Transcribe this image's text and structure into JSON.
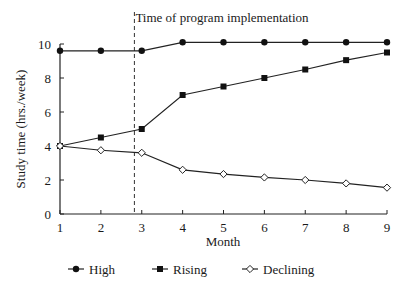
{
  "chart_data": {
    "type": "line",
    "title": "",
    "xlabel": "Month",
    "ylabel": "Study time (hrs./week)",
    "x": [
      1,
      2,
      3,
      4,
      5,
      6,
      7,
      8,
      9
    ],
    "xlim": [
      1,
      9
    ],
    "ylim": [
      0,
      10
    ],
    "xticks": [
      "1",
      "2",
      "3",
      "4",
      "5",
      "6",
      "7",
      "8",
      "9"
    ],
    "yticks": [
      "0",
      "2",
      "4",
      "6",
      "8",
      "10"
    ],
    "grid": false,
    "legend_position": "bottom",
    "series": [
      {
        "name": "High",
        "marker": "filled-circle",
        "values": [
          9.6,
          9.6,
          9.6,
          10.1,
          10.1,
          10.1,
          10.1,
          10.1,
          10.1
        ]
      },
      {
        "name": "Rising",
        "marker": "filled-square",
        "values": [
          4.0,
          4.5,
          5.0,
          7.0,
          7.5,
          8.0,
          8.5,
          9.05,
          9.5
        ]
      },
      {
        "name": "Declining",
        "marker": "open-diamond",
        "values": [
          4.0,
          3.75,
          3.6,
          2.6,
          2.35,
          2.15,
          2.0,
          1.8,
          1.55
        ]
      }
    ],
    "annotations": [
      {
        "type": "vertical-dashed-line",
        "x": 2.82,
        "label": "Time of program implementation"
      }
    ]
  },
  "legend": {
    "items": [
      {
        "label": "High"
      },
      {
        "label": "Rising"
      },
      {
        "label": "Declining"
      }
    ]
  }
}
